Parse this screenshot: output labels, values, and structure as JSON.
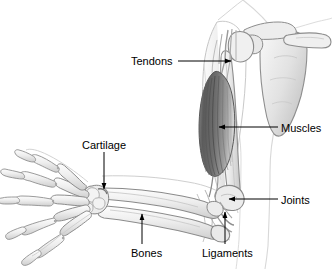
{
  "figure": {
    "background_color": "#ffffff",
    "line_color": "#000000",
    "bone_fill": "#f2f2f2",
    "bone_outline": "#6b6b6b",
    "muscle_dark": "#585858",
    "muscle_mid": "#8c8c8c",
    "muscle_light": "#c9c9c9",
    "skin_outline": "#c0c0c0"
  },
  "labels": [
    {
      "id": "tendons",
      "text": "Tendons",
      "leader": "horizontal-line-with-arrowhead-right",
      "points_to": "shoulder-tendons"
    },
    {
      "id": "muscles",
      "text": "Muscles",
      "leader": "horizontal-line-with-arrowhead-left",
      "points_to": "biceps-muscle"
    },
    {
      "id": "joints",
      "text": "Joints",
      "leader": "horizontal-line-with-arrowhead-left",
      "points_to": "elbow-joint"
    },
    {
      "id": "cartilage",
      "text": "Cartilage",
      "leader": "vertical-line-with-arrowhead-down",
      "points_to": "wrist-cartilage"
    },
    {
      "id": "bones",
      "text": "Bones",
      "leader": "vertical-line-with-arrowhead-up",
      "points_to": "forearm-bones"
    },
    {
      "id": "ligaments",
      "text": "Ligaments",
      "leader": "vertical-line-with-arrowhead-up",
      "points_to": "elbow-ligaments"
    }
  ],
  "anatomy_parts": [
    "scapula",
    "clavicle",
    "humerus",
    "biceps-muscle",
    "radius",
    "ulna",
    "carpals",
    "metacarpals",
    "phalanges",
    "elbow-joint",
    "wrist-joint",
    "shoulder-joint",
    "torso-outline"
  ]
}
